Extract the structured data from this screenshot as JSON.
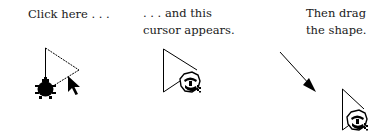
{
  "steps": [
    {
      "id": "step-1",
      "caption_lines": [
        "Click here . . ."
      ],
      "icons": [
        "triangle-shape",
        "bug-icon",
        "arrow-cursor-icon"
      ]
    },
    {
      "id": "step-2",
      "caption_lines": [
        ". . . and this",
        "cursor appears."
      ],
      "icons": [
        "triangle-shape",
        "grab-hand-cursor-icon"
      ]
    },
    {
      "id": "step-3",
      "caption_lines": [
        "Then drag",
        "the shape."
      ],
      "icons": [
        "drag-direction-arrow",
        "triangle-shape",
        "grab-hand-cursor-icon"
      ]
    }
  ],
  "colors": {
    "background": "#ffffff",
    "ink": "#000000",
    "text": "#1a1a1a"
  }
}
